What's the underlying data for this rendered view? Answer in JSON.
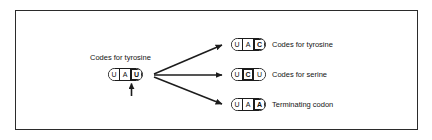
{
  "figure": {
    "border_color": "#2b2b2b",
    "background": "#ffffff",
    "ink_color": "#1c1c1c"
  },
  "source_codon": {
    "caption": "Codes for tyrosine",
    "bases": [
      {
        "letter": "U",
        "marked": false
      },
      {
        "letter": "A",
        "marked": false
      },
      {
        "letter": "U",
        "marked": true
      }
    ],
    "pointer_icon": "up-arrow-icon"
  },
  "branches": [
    {
      "arrow_icon": "arrow-right-up-icon",
      "bases": [
        {
          "letter": "U",
          "marked": false
        },
        {
          "letter": "A",
          "marked": false
        },
        {
          "letter": "C",
          "marked": true
        }
      ],
      "label": "Codes for tyrosine"
    },
    {
      "arrow_icon": "arrow-right-icon",
      "bases": [
        {
          "letter": "U",
          "marked": false
        },
        {
          "letter": "C",
          "marked": true
        },
        {
          "letter": "U",
          "marked": false
        }
      ],
      "label": "Codes for serine"
    },
    {
      "arrow_icon": "arrow-right-down-icon",
      "bases": [
        {
          "letter": "U",
          "marked": false
        },
        {
          "letter": "A",
          "marked": false
        },
        {
          "letter": "A",
          "marked": true
        }
      ],
      "label": "Terminating codon"
    }
  ]
}
